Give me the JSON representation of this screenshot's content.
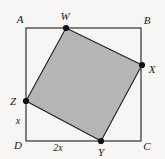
{
  "figure": {
    "kind": "geometry-diagram",
    "width": 165,
    "height": 159,
    "background_color": "#f7f6f4",
    "outer_square": {
      "name": "ABCD",
      "stroke_color": "#1d1e20",
      "fill": "none",
      "corners": [
        {
          "id": "A",
          "label": "A",
          "x": 26,
          "y": 28,
          "label_x": 20,
          "label_y": 19
        },
        {
          "id": "B",
          "label": "B",
          "x": 141,
          "y": 28,
          "label_x": 147,
          "label_y": 20
        },
        {
          "id": "C",
          "label": "C",
          "x": 141,
          "y": 141,
          "label_x": 147,
          "label_y": 146
        },
        {
          "id": "D",
          "label": "D",
          "x": 26,
          "y": 141,
          "label_x": 18,
          "label_y": 145
        }
      ]
    },
    "inner_quad": {
      "name": "WXYZ",
      "fill_color": "#b5b5b5",
      "stroke_color": "#1d1e20",
      "vertex_dot_color": "#111214",
      "vertices": [
        {
          "id": "W",
          "label": "W",
          "x": 66,
          "y": 28,
          "on_edge": "AB",
          "label_x": 65,
          "label_y": 16
        },
        {
          "id": "X",
          "label": "X",
          "x": 142,
          "y": 65,
          "on_edge": "BC",
          "label_x": 152,
          "label_y": 69
        },
        {
          "id": "Y",
          "label": "Y",
          "x": 101,
          "y": 141,
          "on_edge": "DC",
          "label_x": 101,
          "label_y": 152
        },
        {
          "id": "Z",
          "label": "Z",
          "x": 26,
          "y": 101,
          "on_edge": "AD",
          "label_x": 13,
          "label_y": 101
        }
      ]
    },
    "dimension_labels": [
      {
        "id": "zd",
        "text": "x",
        "segment": "ZD",
        "label_x": 18,
        "label_y": 121
      },
      {
        "id": "dy",
        "text": "2x",
        "segment": "DY",
        "label_x": 58,
        "label_y": 148
      }
    ]
  }
}
